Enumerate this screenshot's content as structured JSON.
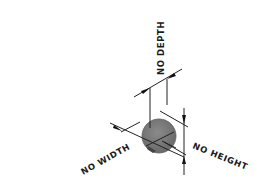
{
  "diagram": {
    "type": "isometric-dimension-drawing",
    "colors": {
      "background": "#ffffff",
      "sphere_fill": "#7a7a7a",
      "sphere_edge": "#5e5e5e",
      "line": "#222222",
      "text": "#1a1a1a"
    },
    "labels": {
      "depth": "NO DEPTH",
      "width": "NO WIDTH",
      "height": "NO HEIGHT"
    }
  }
}
